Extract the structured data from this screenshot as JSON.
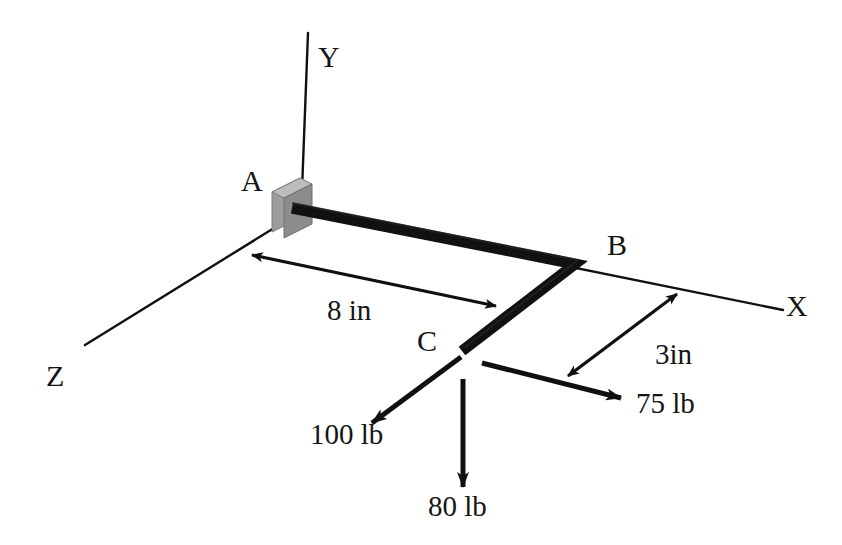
{
  "figure": {
    "background_color": "#ffffff",
    "line_color": "#101010",
    "member_color": "#111111",
    "support_face_color": "#9a9a9a",
    "support_top_color": "#b5b5b5",
    "support_side_color": "#828282"
  },
  "axes": [
    {
      "name": "y-axis",
      "label": "Y"
    },
    {
      "name": "x-axis",
      "label": "X"
    },
    {
      "name": "z-axis",
      "label": "Z"
    }
  ],
  "axis_labels": {
    "y": "Y",
    "x": "X",
    "z": "Z"
  },
  "points": {
    "a": "A",
    "b": "B",
    "c": "C"
  },
  "dimensions": [
    {
      "name": "ab-length",
      "label": "8 in",
      "value": 8,
      "unit": "in"
    },
    {
      "name": "bc-offset",
      "label": "3in",
      "value": 3,
      "unit": "in"
    }
  ],
  "dimension_labels": {
    "ab": "8 in",
    "bc": "3in"
  },
  "forces": [
    {
      "name": "force-100lb",
      "label": "100 lb",
      "magnitude": 100,
      "unit": "lb",
      "direction": "down-left"
    },
    {
      "name": "force-80lb",
      "label": "80 lb",
      "magnitude": 80,
      "unit": "lb",
      "direction": "down"
    },
    {
      "name": "force-75lb",
      "label": "75 lb",
      "magnitude": 75,
      "unit": "lb",
      "direction": "down-right"
    }
  ],
  "force_labels": {
    "f100": "100 lb",
    "f80": "80 lb",
    "f75": "75 lb"
  }
}
